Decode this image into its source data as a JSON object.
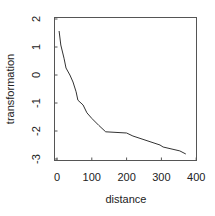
{
  "chart_data": {
    "type": "line",
    "title": "",
    "xlabel": "distance",
    "ylabel": "transformation",
    "xlim": [
      -5,
      400
    ],
    "ylim": [
      -3,
      2.2
    ],
    "xticks": [
      0,
      100,
      200,
      300,
      400
    ],
    "yticks": [
      -3,
      -2,
      -1,
      0,
      1,
      2
    ],
    "xtick_labels": [
      "0",
      "100",
      "200",
      "300",
      "400"
    ],
    "ytick_labels": [
      "-3",
      "-2",
      "-1",
      "0",
      "1",
      "2"
    ],
    "grid": false,
    "legend": null,
    "line_color": "#333333",
    "series": [
      {
        "name": "transformation",
        "x": [
          6,
          11,
          20,
          26,
          37,
          46,
          55,
          60,
          75,
          86,
          100,
          120,
          140,
          200,
          218,
          296,
          305,
          353,
          370
        ],
        "y": [
          1.57,
          1.07,
          0.6,
          0.25,
          0.0,
          -0.25,
          -0.6,
          -0.9,
          -1.07,
          -1.35,
          -1.55,
          -1.8,
          -2.03,
          -2.07,
          -2.18,
          -2.5,
          -2.57,
          -2.71,
          -2.82
        ]
      }
    ]
  }
}
